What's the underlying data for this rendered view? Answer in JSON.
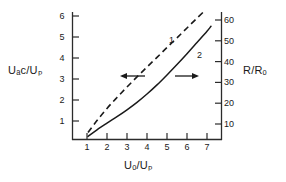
{
  "chart_data": {
    "type": "line",
    "title": "",
    "xlabel": "Uₒ/Uₚ",
    "ylabel": "Uₐс/Uₚ",
    "ylabel_right": "R/Rₒ",
    "xlim": [
      0.5,
      7.6
    ],
    "ylim": [
      0.2,
      6.6
    ],
    "ylim_right": [
      2,
      66
    ],
    "xticks": [
      1,
      2,
      3,
      4,
      5,
      6,
      7
    ],
    "xtick_labels": [
      "1",
      "2",
      "3",
      "4",
      "5",
      "6",
      "7"
    ],
    "yticks": [
      1,
      2,
      3,
      4,
      5,
      6
    ],
    "ytick_labels": [
      "1",
      "2",
      "3",
      "4",
      "5",
      "6"
    ],
    "yticks_right": [
      10,
      20,
      30,
      40,
      50,
      60
    ],
    "ytick_labels_right": [
      "10",
      "20",
      "30",
      "40",
      "50",
      "60"
    ],
    "grid": false,
    "legend": "none",
    "series": [
      {
        "name": "1",
        "label": "1",
        "style": "dashed",
        "axis": "left",
        "arrow": "left",
        "x": [
          1.05,
          1.5,
          2.0,
          2.5,
          3.0,
          3.5,
          4.0,
          4.5,
          5.0,
          5.5,
          6.0,
          6.5,
          6.85
        ],
        "y": [
          0.45,
          1.02,
          1.6,
          2.12,
          2.62,
          3.1,
          3.57,
          4.03,
          4.5,
          4.96,
          5.43,
          5.9,
          6.22
        ]
      },
      {
        "name": "2",
        "label": "2",
        "style": "solid",
        "axis": "right",
        "arrow": "right",
        "x": [
          1.05,
          1.5,
          2.0,
          2.5,
          3.0,
          3.5,
          4.0,
          4.5,
          5.0,
          5.5,
          6.0,
          6.5,
          7.0,
          7.2
        ],
        "y_right": [
          4.0,
          7.2,
          10.4,
          13.5,
          16.8,
          20.4,
          24.4,
          28.8,
          33.6,
          38.6,
          43.8,
          49.2,
          54.6,
          57.0
        ]
      }
    ],
    "annotations": [
      {
        "name": "arrow-left",
        "text": "←",
        "points_to": "left-axis"
      },
      {
        "name": "arrow-right",
        "text": "→",
        "points_to": "right-axis"
      }
    ]
  },
  "labels": {
    "curve1": "1",
    "curve2": "2"
  }
}
